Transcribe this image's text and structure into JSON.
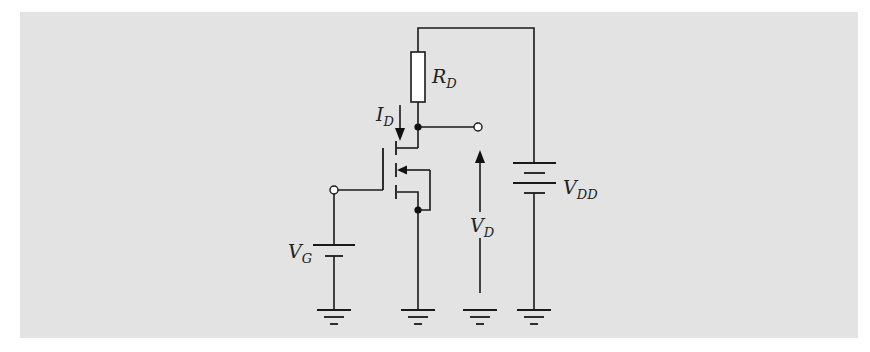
{
  "diagram": {
    "type": "circuit-schematic",
    "background_color": "#e3e3e3",
    "line_color": "#1a1a1a",
    "labels": {
      "rd": {
        "main": "R",
        "sub": "D"
      },
      "id": {
        "main": "I",
        "sub": "D"
      },
      "vg": {
        "main": "V",
        "sub": "G"
      },
      "vd": {
        "main": "V",
        "sub": "D"
      },
      "vdd": {
        "main": "V",
        "sub": "DD"
      }
    },
    "components": [
      "resistor R_D",
      "n-channel enhancement MOSFET",
      "battery V_G",
      "battery V_DD",
      "gate input terminal",
      "drain output terminal",
      "ground x4"
    ]
  }
}
